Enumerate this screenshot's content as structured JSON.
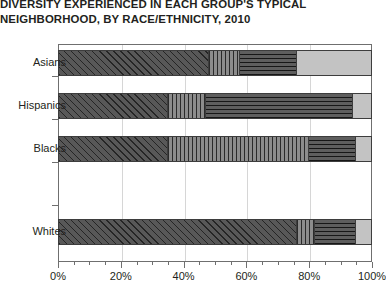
{
  "title": {
    "line1": "DIVERSITY EXPERIENCED IN EACH GROUP'S TYPICAL",
    "line2": "NEIGHBORHOOD, BY RACE/ETHNICITY, 2010"
  },
  "axis": {
    "x_ticks": [
      "0%",
      "20%",
      "40%",
      "60%",
      "80%",
      "100%"
    ],
    "y_categories": [
      "Asians",
      "Hispanics",
      "Blacks",
      "Whites"
    ]
  },
  "chart_data": {
    "type": "bar",
    "orientation": "horizontal",
    "stacked": true,
    "normalized_percent": true,
    "title": "DIVERSITY EXPERIENCED IN EACH GROUP'S TYPICAL NEIGHBORHOOD, BY RACE/ETHNICITY, 2010",
    "xlabel": "",
    "ylabel": "",
    "xlim": [
      0,
      100
    ],
    "xticks": [
      0,
      20,
      40,
      60,
      80,
      100
    ],
    "xticklabels": [
      "0%",
      "20%",
      "40%",
      "60%",
      "80%",
      "100%"
    ],
    "minor_tick_interval": 5,
    "grid": "vertical",
    "legend": "none",
    "categories": [
      "Asians",
      "Hispanics",
      "Blacks",
      "Whites"
    ],
    "series": [
      {
        "name": "segment-1",
        "pattern": "diagonal-hatch",
        "color": "#585858",
        "values": [
          48,
          35,
          35,
          76
        ]
      },
      {
        "name": "segment-2",
        "pattern": "vertical-lines",
        "color": "#8c8c8c",
        "values": [
          10,
          12,
          45,
          6
        ]
      },
      {
        "name": "segment-3",
        "pattern": "horizontal-lines",
        "color": "#5e5e5e",
        "values": [
          18,
          47,
          15,
          13
        ]
      },
      {
        "name": "segment-4",
        "pattern": "solid-light-gray",
        "color": "#c3c3c3",
        "values": [
          24,
          6,
          5,
          5
        ]
      }
    ]
  },
  "layout": {
    "bar_tops": [
      50,
      93,
      136,
      219
    ],
    "label_tops": [
      56,
      99,
      142,
      225
    ],
    "ytick_tops": [
      76,
      119,
      162,
      205
    ]
  }
}
